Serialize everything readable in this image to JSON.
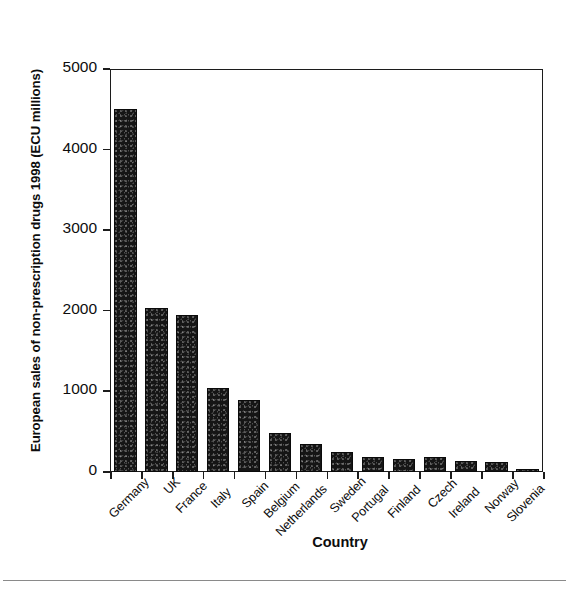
{
  "chart_data": {
    "type": "bar",
    "title": "",
    "xlabel": "Country",
    "ylabel": "European sales of non-prescription drugs 1998 (ECU millions)",
    "categories": [
      "Germany",
      "UK",
      "France",
      "Italy",
      "Spain",
      "Belgium",
      "Netherlands",
      "Sweden",
      "Portugal",
      "Finland",
      "Czech",
      "Ireland",
      "Norway",
      "Slovenia"
    ],
    "values": [
      4500,
      2030,
      1950,
      1040,
      890,
      490,
      350,
      250,
      190,
      165,
      190,
      140,
      120,
      40
    ],
    "ylim": [
      0,
      5000
    ],
    "yticks": [
      0,
      1000,
      2000,
      3000,
      4000,
      5000
    ],
    "ytick_labels": [
      "0",
      "1000",
      "2000",
      "3000",
      "4000",
      "5000"
    ],
    "grid": false,
    "legend": "none",
    "bar_color": "#151515",
    "axis_color": "#1c1c1c",
    "background": "#ffffff"
  },
  "figure": {
    "y_axis_title": "European sales of non-prescription drugs 1998 (ECU millions)",
    "x_axis_title": "Country"
  }
}
